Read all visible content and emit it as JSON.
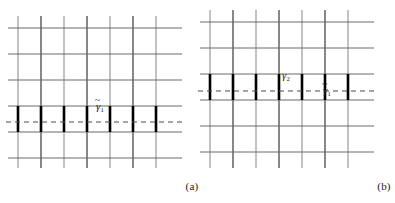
{
  "figure": {
    "type": "lattice-path-diagram",
    "background": "#ffffff",
    "panels": [
      {
        "id": "a",
        "caption": "(a)",
        "origin_x": 0,
        "frame": {
          "x": 14,
          "y": 16,
          "w": 164,
          "h": 152
        },
        "grid": {
          "v_count": 7,
          "h_count": 6,
          "v_xs": [
            18,
            41,
            64,
            87,
            110,
            133,
            156
          ],
          "h_ys": [
            28,
            54,
            80,
            106,
            132,
            158
          ],
          "v_colors": [
            "#a8a8a8",
            "#555555",
            "#a8a8a8",
            "#555555",
            "#a8a8a8",
            "#555555",
            "#a8a8a8"
          ],
          "h_color": "#6a6a6a",
          "v_width": 1.4,
          "h_width": 1.0
        },
        "dashed_path": {
          "label": "gamma-tilde-1",
          "y": 122,
          "x_start": 14,
          "x_end": 178,
          "color": "#4a4a4a",
          "dash": "5 4",
          "width": 1.1
        },
        "bold_edges": {
          "color": "#000000",
          "width": 2.6,
          "y_top": 106,
          "y_bottom": 132,
          "xs": [
            18,
            41,
            64,
            87,
            110,
            133,
            156
          ],
          "count": 7
        },
        "labels": [
          {
            "name": "gamma-tilde-1",
            "text": "γ",
            "sub": "1",
            "tilde": true,
            "x": 96,
            "y": 101
          }
        ]
      },
      {
        "id": "b",
        "caption": "(b)",
        "origin_x": 192,
        "frame": {
          "x": 14,
          "y": 10,
          "w": 164,
          "h": 158
        },
        "grid": {
          "v_count": 7,
          "h_count": 6,
          "v_xs": [
            18,
            41,
            64,
            87,
            110,
            133,
            156
          ],
          "h_ys": [
            22,
            48,
            74,
            100,
            126,
            152
          ],
          "v_colors": [
            "#a8a8a8",
            "#555555",
            "#a8a8a8",
            "#555555",
            "#a8a8a8",
            "#555555",
            "#a8a8a8"
          ],
          "h_color": "#6a6a6a",
          "v_width": 1.4,
          "h_width": 1.0
        },
        "dashed_path": {
          "label": "gamma-tilde-1",
          "y": 91,
          "x_start": 14,
          "x_end": 178,
          "color": "#4a4a4a",
          "dash": "5 4",
          "width": 1.1
        },
        "bold_edges": {
          "color": "#000000",
          "width": 2.6,
          "y_top": 74,
          "y_bottom": 100,
          "xs": [
            18,
            41,
            64,
            87,
            110,
            133,
            156
          ],
          "count": 7
        },
        "labels": [
          {
            "name": "gamma-2",
            "text": "γ",
            "sub": "2",
            "tilde": false,
            "x": 90,
            "y": 70
          },
          {
            "name": "gamma-tilde-1",
            "text": "γ",
            "sub": "1",
            "tilde": true,
            "x": 131,
            "y": 85
          }
        ]
      }
    ],
    "text": {
      "caption_a": "(a)",
      "caption_b": "(b)",
      "gamma": "γ",
      "sub_1": "1",
      "sub_2": "2"
    },
    "colors": {
      "grid_light": "#a8a8a8",
      "grid_dark": "#555555",
      "grid_horizontal": "#6a6a6a",
      "bold_edge": "#000000",
      "dashed": "#4a4a4a",
      "text": "#1b1b1b",
      "background": "#ffffff"
    }
  }
}
